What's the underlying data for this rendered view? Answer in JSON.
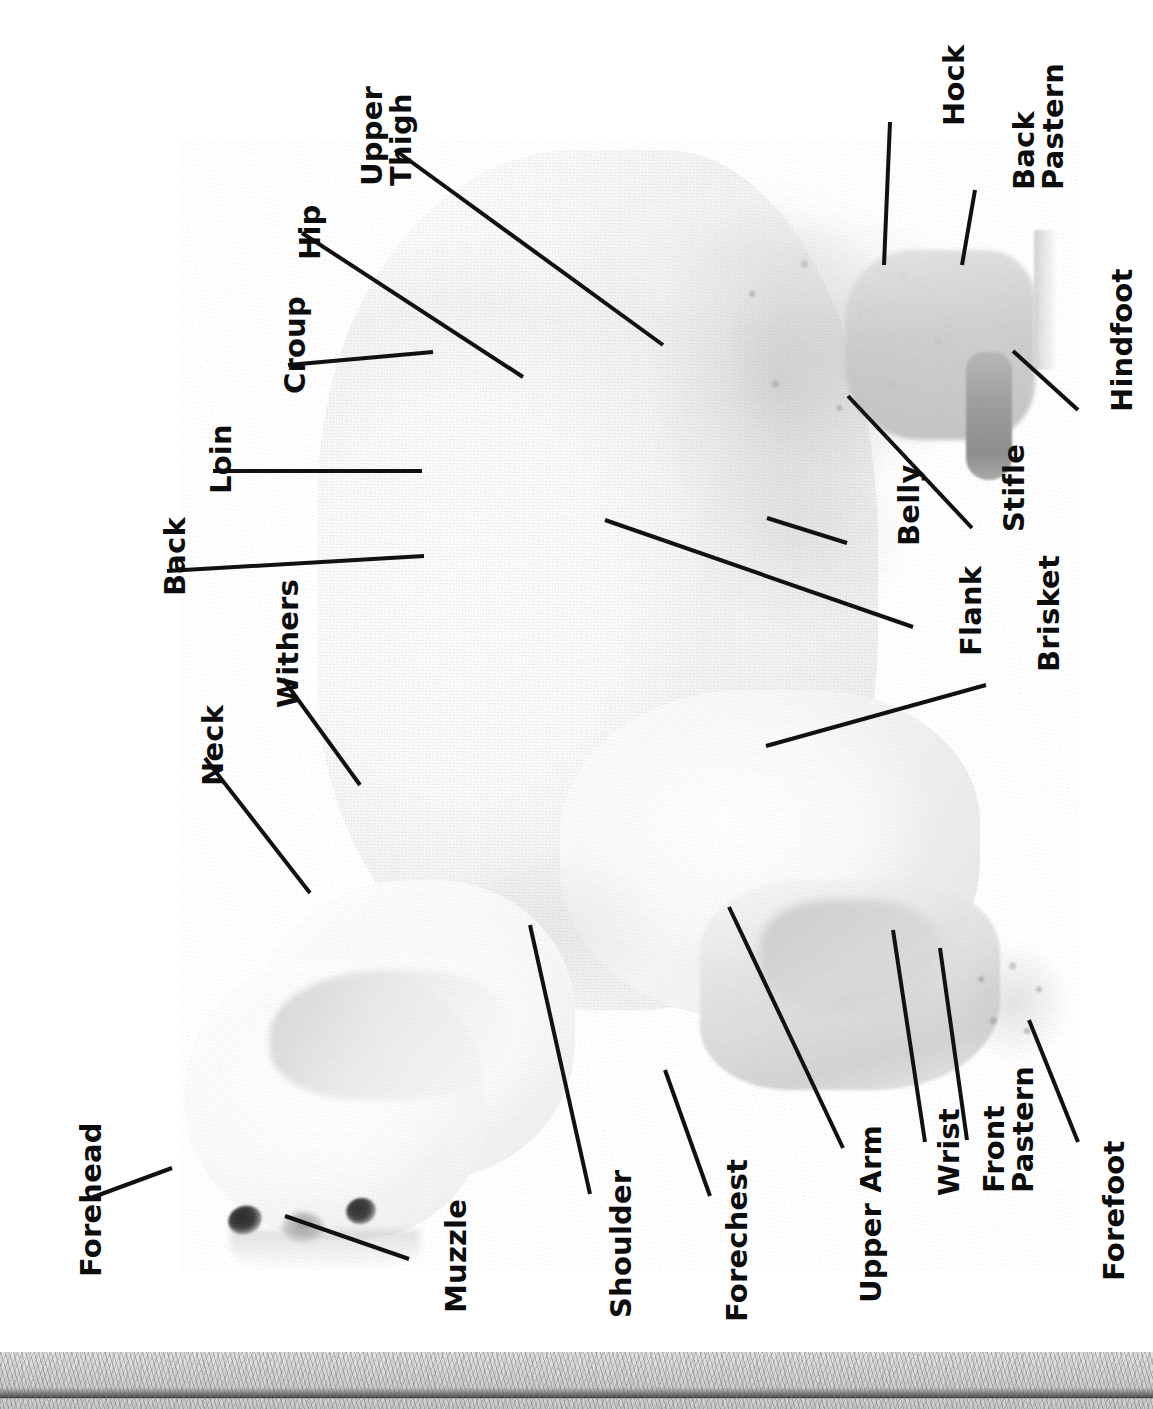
{
  "diagram": {
    "orientation": "labels rotated 90 degrees counter-clockwise",
    "text_color": "#0d0d0d",
    "line_color": "#111111",
    "background_color": "#ffffff",
    "ground_color": "#d6d6d6"
  },
  "labels": [
    {
      "id": "hock",
      "text": "Hock"
    },
    {
      "id": "back-pastern",
      "text": "Back\nPastern"
    },
    {
      "id": "upper-thigh",
      "text": "Upper\nThigh"
    },
    {
      "id": "hip",
      "text": "Hip"
    },
    {
      "id": "croup",
      "text": "Croup"
    },
    {
      "id": "loin",
      "text": "Loin"
    },
    {
      "id": "back",
      "text": "Back"
    },
    {
      "id": "withers",
      "text": "Withers"
    },
    {
      "id": "neck",
      "text": "Neck"
    },
    {
      "id": "hindfoot",
      "text": "Hindfoot"
    },
    {
      "id": "belly",
      "text": "Belly"
    },
    {
      "id": "stifle",
      "text": "Stifle"
    },
    {
      "id": "flank",
      "text": "Flank"
    },
    {
      "id": "brisket",
      "text": "Brisket"
    },
    {
      "id": "forehead",
      "text": "Forehead"
    },
    {
      "id": "muzzle",
      "text": "Muzzle"
    },
    {
      "id": "shoulder",
      "text": "Shoulder"
    },
    {
      "id": "forechest",
      "text": "Forechest"
    },
    {
      "id": "upper-arm",
      "text": "Upper Arm"
    },
    {
      "id": "wrist",
      "text": "Wrist"
    },
    {
      "id": "front-pastern",
      "text": "Front\nPastern"
    },
    {
      "id": "forefoot",
      "text": "Forefoot"
    }
  ]
}
